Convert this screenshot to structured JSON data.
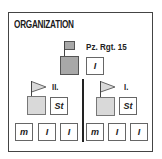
{
  "title": "ORGANIZATION",
  "regiment": {
    "label": "Pz. Rgt. 15",
    "hq_box": "",
    "staff_box": "I"
  },
  "battalions": [
    {
      "label": "II.",
      "staff_box": "St",
      "companies": [
        "m",
        "I",
        "I"
      ]
    },
    {
      "label": "I.",
      "staff_box": "St",
      "companies": [
        "m",
        "I",
        "I"
      ]
    }
  ],
  "colors": {
    "regiment_fill": "#a8a8a8",
    "battalion_fill": "#d9d9d9",
    "border": "#444444"
  }
}
